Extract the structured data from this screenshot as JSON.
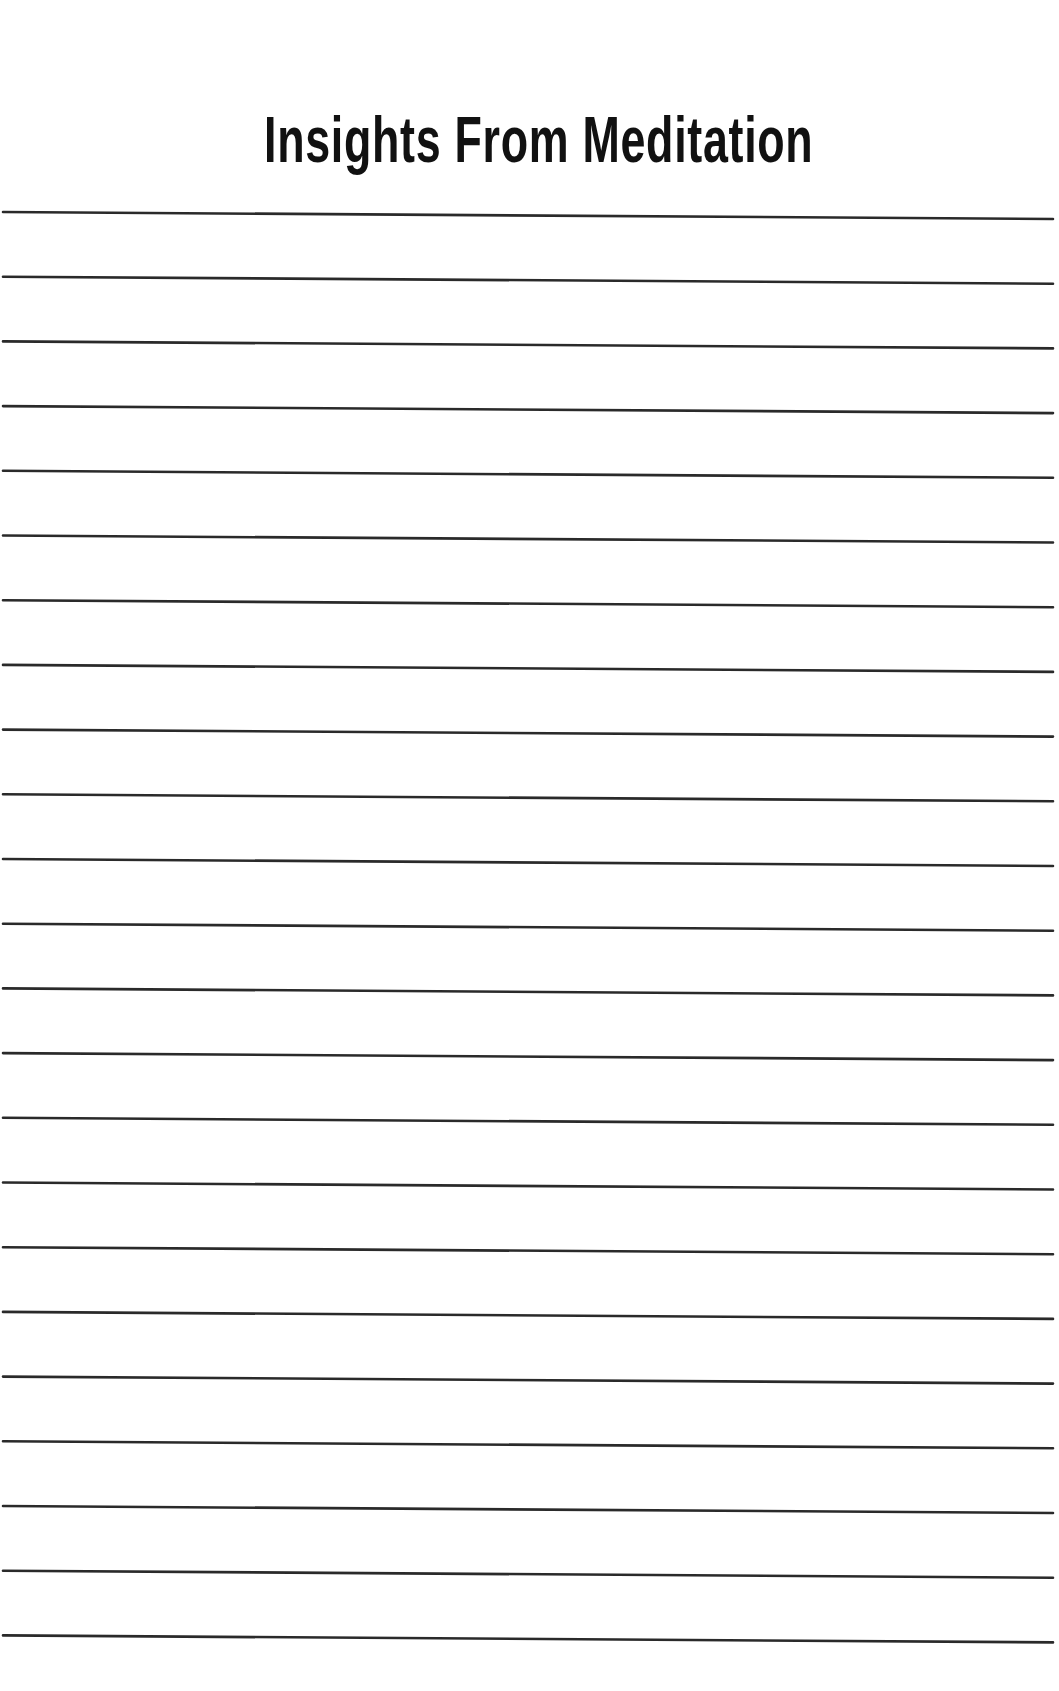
{
  "page": {
    "title": "Insights From Meditation",
    "background_color": "#ffffff",
    "title_color": "#111111",
    "line_color": "#2a2a2a",
    "ruled_lines": {
      "count": 23,
      "first_y_left": 212,
      "spacing": 64.7,
      "x_start": 3,
      "x_end": 1053,
      "right_end_offset": 7,
      "stroke_width": 2.6
    },
    "writing_lines": [
      {
        "text": ""
      },
      {
        "text": ""
      },
      {
        "text": ""
      },
      {
        "text": ""
      },
      {
        "text": ""
      },
      {
        "text": ""
      },
      {
        "text": ""
      },
      {
        "text": ""
      },
      {
        "text": ""
      },
      {
        "text": ""
      },
      {
        "text": ""
      },
      {
        "text": ""
      },
      {
        "text": ""
      },
      {
        "text": ""
      },
      {
        "text": ""
      },
      {
        "text": ""
      },
      {
        "text": ""
      },
      {
        "text": ""
      },
      {
        "text": ""
      },
      {
        "text": ""
      },
      {
        "text": ""
      },
      {
        "text": ""
      },
      {
        "text": ""
      }
    ]
  }
}
